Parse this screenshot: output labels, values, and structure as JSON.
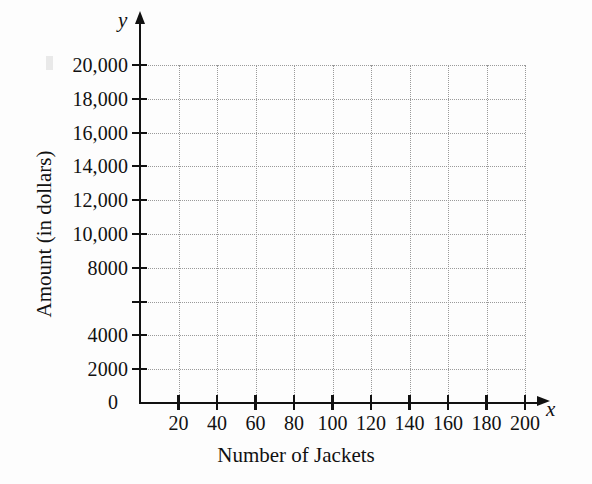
{
  "figure": {
    "background_color": "#fdfdfd",
    "axis_color": "#111111",
    "grid_color": "#9a9a9a"
  },
  "axes": {
    "x_variable": "x",
    "y_variable": "y",
    "origin_label": "0",
    "x_title": "Number of Jackets",
    "y_title": "Amount (in dollars)"
  },
  "chart_data": {
    "type": "scatter",
    "title": "",
    "subtitle": "",
    "xlabel": "Number of Jackets",
    "ylabel": "Amount (in dollars)",
    "x_variable": "x",
    "y_variable": "y",
    "xlim": [
      0,
      200
    ],
    "ylim": [
      0,
      20000
    ],
    "x_tick_values": [
      20,
      40,
      60,
      80,
      100,
      120,
      140,
      160,
      180,
      200
    ],
    "x_tick_labels": [
      "20",
      "40",
      "60",
      "80",
      "100",
      "120",
      "140",
      "160",
      "180",
      "200"
    ],
    "y_tick_values": [
      2000,
      4000,
      6000,
      8000,
      10000,
      12000,
      14000,
      16000,
      18000,
      20000
    ],
    "y_tick_labels": [
      "2000",
      "4000",
      "",
      "8000",
      "10,000",
      "12,000",
      "14,000",
      "16,000",
      "18,000",
      "20,000"
    ],
    "origin_label": "0",
    "grid": true,
    "grid_style": "dotted",
    "legend": false,
    "legend_position": "none",
    "series": [],
    "values": [],
    "annotations": []
  }
}
